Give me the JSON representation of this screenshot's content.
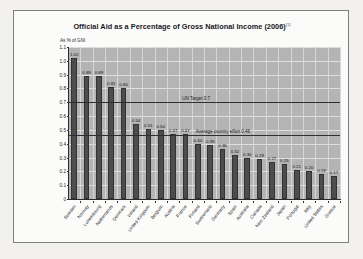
{
  "figure": {
    "title": "Official Aid as a Percentage of Gross National Income (2006)",
    "title_superscript": "[1]",
    "y_axis_title": "As % of GNI"
  },
  "chart_data": {
    "type": "bar",
    "title": "Official Aid as a Percentage of Gross National Income (2006)",
    "xlabel": "",
    "ylabel": "As % of GNI",
    "ylim": [
      0,
      1.1
    ],
    "ytick_labels": [
      "1.1",
      "1.0",
      "0.9",
      "0.8",
      "0.7",
      "0.6",
      "0.5",
      "0.4",
      "0.3",
      "0.2",
      "0.1",
      "0"
    ],
    "ytick_values": [
      1.1,
      1.0,
      0.9,
      0.8,
      0.7,
      0.6,
      0.5,
      0.4,
      0.3,
      0.2,
      0.1,
      0
    ],
    "grid": true,
    "legend": "none",
    "categories": [
      "Sweden",
      "Norway",
      "Luxembourg",
      "Netherlands",
      "Denmark",
      "Ireland",
      "United Kingdom",
      "Belgium",
      "Austria",
      "France",
      "Finland",
      "Switzerland",
      "Germany",
      "Spain",
      "Australia",
      "Canada",
      "New Zealand",
      "Japan",
      "Portugal",
      "Italy",
      "United States",
      "Greece"
    ],
    "values": [
      1.02,
      0.89,
      0.89,
      0.81,
      0.8,
      0.54,
      0.51,
      0.5,
      0.47,
      0.47,
      0.4,
      0.39,
      0.36,
      0.32,
      0.3,
      0.29,
      0.27,
      0.25,
      0.21,
      0.2,
      0.18,
      0.17
    ],
    "value_labels": [
      "1.02",
      "0.89",
      "0.89",
      "0.81",
      "0.80",
      "0.54",
      "0.51",
      "0.50",
      "0.47",
      "0.47",
      "0.40",
      "0.39",
      "0.36",
      "0.32",
      "0.30",
      "0.29",
      "0.27",
      "0.25",
      "0.21",
      "0.20",
      "0.18",
      "0.17"
    ],
    "reference_lines": [
      {
        "label": "UN Target 0.7",
        "value": 0.7
      },
      {
        "label": "Average country effort 0.46",
        "value": 0.46
      }
    ],
    "bar_color": "#4d4d4d",
    "plot_background": "#b4b4b4"
  }
}
